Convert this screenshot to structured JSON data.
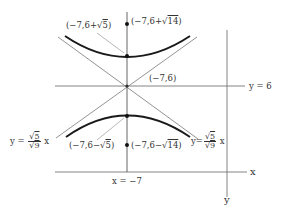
{
  "diagram": {
    "type": "hyperbola",
    "center": {
      "label": "(−7,6)",
      "x": -7,
      "y": 6
    },
    "points": [
      {
        "name": "vertex-top",
        "label_prefix": "(−7,6+",
        "radicand": "5",
        "label_suffix": ")"
      },
      {
        "name": "focus-top",
        "label_prefix": "(−7,6+",
        "radicand": "14",
        "label_suffix": ")"
      },
      {
        "name": "vertex-bottom",
        "label_prefix": "(−7,6−",
        "radicand": "5",
        "label_suffix": ")"
      },
      {
        "name": "focus-bottom",
        "label_prefix": "(−7,6−",
        "radicand": "14",
        "label_suffix": ")"
      }
    ],
    "lines": {
      "horizontal": "y = 6",
      "vertical": "x = −7"
    },
    "asymptotes": {
      "left": {
        "prefix": "y = ",
        "num": "5",
        "den": "9",
        "suffix": " x"
      },
      "right": {
        "prefix": "y=",
        "num": "5",
        "den": "9",
        "suffix": " x"
      }
    },
    "axes": {
      "x": "x",
      "y": "y"
    },
    "sqrt_symbol": "√",
    "colors": {
      "curve": "#1a1a1a",
      "line": "#777777",
      "text": "#333333"
    }
  }
}
